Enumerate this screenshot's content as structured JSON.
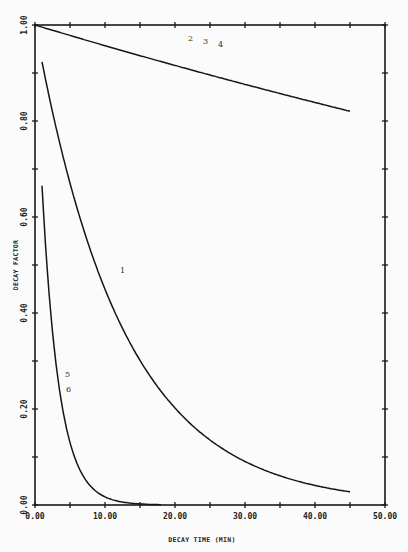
{
  "chart_data": {
    "type": "line",
    "title": "",
    "xlabel": "DECAY TIME (MIN)",
    "ylabel": "DECAY FACTOR",
    "xlim": [
      0,
      50
    ],
    "ylim": [
      0,
      1
    ],
    "grid": false,
    "legend": "inline curve number labels",
    "x_ticks": [
      0,
      10,
      20,
      30,
      40,
      50
    ],
    "x_tick_labels": [
      "0.00",
      "10.00",
      "20.00",
      "30.00",
      "40.00",
      "50.00"
    ],
    "x_minor_step": 5,
    "y_ticks": [
      0,
      0.2,
      0.4,
      0.6,
      0.8,
      1.0
    ],
    "y_tick_labels": [
      "0.00",
      "0.20",
      "0.40",
      "0.60",
      "0.80",
      "1.00"
    ],
    "y_minor_step": 0.1,
    "series": [
      {
        "name": "2 3 4",
        "label_text": [
          "2",
          "3",
          "4"
        ],
        "x": [
          0,
          5,
          10,
          15,
          20,
          25,
          30,
          35,
          40,
          45
        ],
        "values": [
          1.0,
          0.978,
          0.957,
          0.936,
          0.916,
          0.896,
          0.876,
          0.857,
          0.839,
          0.821
        ]
      },
      {
        "name": "1",
        "label_text": "1",
        "x": [
          1,
          2,
          4,
          6,
          8,
          10,
          12,
          15,
          20,
          25,
          30,
          35,
          40,
          45
        ],
        "values": [
          0.923,
          0.852,
          0.726,
          0.619,
          0.527,
          0.449,
          0.383,
          0.301,
          0.202,
          0.135,
          0.091,
          0.061,
          0.041,
          0.027
        ]
      },
      {
        "name": "5 6",
        "label_text": [
          "5",
          "6"
        ],
        "x": [
          1,
          1.5,
          2,
          3,
          4,
          5,
          6,
          7,
          8,
          10,
          12,
          15,
          18
        ],
        "values": [
          0.665,
          0.542,
          0.442,
          0.294,
          0.195,
          0.13,
          0.086,
          0.057,
          0.038,
          0.017,
          0.007,
          0.002,
          0.0
        ]
      }
    ]
  }
}
